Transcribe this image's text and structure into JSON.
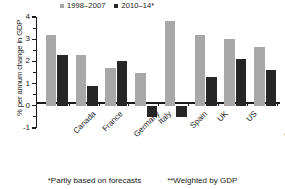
{
  "chart_data": {
    "type": "bar",
    "title": "",
    "xlabel": "",
    "ylabel": "% per annum change in GDP",
    "ylim": [
      -1,
      4
    ],
    "yticks": [
      -1,
      0,
      1,
      2,
      3,
      4
    ],
    "ytick_labels": [
      "-1",
      "0",
      "1",
      "2",
      "3",
      "4"
    ],
    "grid": false,
    "legend_position": "top-center",
    "categories": [
      "Canada",
      "France",
      "Germany",
      "Italy",
      "Spain",
      "UK",
      "US",
      "Average**"
    ],
    "series": [
      {
        "name": "1998–2007",
        "color": "#a8a8a8",
        "values": [
          3.2,
          2.3,
          1.7,
          1.5,
          3.8,
          3.2,
          3.0,
          2.65
        ]
      },
      {
        "name": "2010–14*",
        "color": "#262626",
        "values": [
          2.3,
          0.9,
          2.0,
          -0.5,
          -0.5,
          1.3,
          2.1,
          1.6
        ]
      }
    ],
    "annotations": [
      "*Partly based on forecasts",
      "**Weighted by GDP"
    ]
  },
  "legend": {
    "items": [
      {
        "label": "1998–2007",
        "color": "#a8a8a8"
      },
      {
        "label": "2010–14*",
        "color": "#262626"
      }
    ]
  },
  "axis": {
    "y_title": "% per annum change in GDP"
  },
  "footnotes": {
    "left": "*Partly based on forecasts",
    "right": "**Weighted by GDP"
  }
}
